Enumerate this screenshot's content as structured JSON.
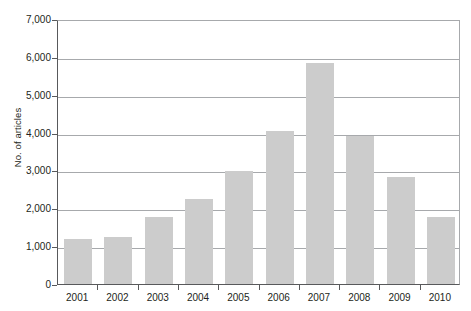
{
  "chart_data": {
    "type": "bar",
    "title": "",
    "xlabel": "",
    "ylabel": "No. of articles",
    "categories": [
      "2001",
      "2002",
      "2003",
      "2004",
      "2005",
      "2006",
      "2007",
      "2008",
      "2009",
      "2010"
    ],
    "values": [
      1200,
      1250,
      1780,
      2250,
      2980,
      4050,
      5850,
      3920,
      2840,
      1780
    ],
    "ylim": [
      0,
      7000
    ],
    "ytick_labels": [
      "0",
      "1,000",
      "2,000",
      "3,000",
      "4,000",
      "5,000",
      "6,000",
      "7,000"
    ],
    "ytick_values": [
      0,
      1000,
      2000,
      3000,
      4000,
      5000,
      6000,
      7000
    ],
    "grid": "horizontal",
    "legend": "none",
    "bar_color": "#cccccc",
    "axis_color": "#58595b",
    "grid_color": "#a7a9ac",
    "background": "#ffffff"
  }
}
